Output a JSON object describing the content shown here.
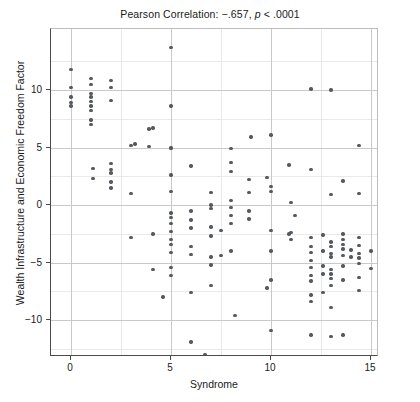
{
  "chart_data": {
    "type": "scatter",
    "title": "Pearson Correlation: −.657, p < .0001",
    "title_parts": {
      "prefix": "Pearson Correlation: −.657, ",
      "p_italic": "p",
      "suffix": " < .0001"
    },
    "xlabel": "Syndrome",
    "ylabel": "Wealth Infrastructure and Economic Freedom Factor",
    "xlim": [
      -1.0,
      15.4
    ],
    "ylim": [
      -13.2,
      15.3
    ],
    "xticks": [
      0,
      5,
      10,
      15
    ],
    "xtick_labels": [
      "0",
      "5",
      "10",
      "15"
    ],
    "yticks": [
      -10,
      -5,
      0,
      5,
      10
    ],
    "ytick_labels": [
      "−10",
      "−5",
      "0",
      "5",
      "10"
    ],
    "grid": true,
    "grid_major_step_x": 5,
    "grid_minor_step_x": 2.5,
    "grid_major_step_y": 5,
    "grid_minor_step_y": 2.5,
    "legend": null,
    "marker_color": "#555a5e",
    "marker_size": 3.4,
    "n_points": 144,
    "points": [
      [
        0.0,
        11.8
      ],
      [
        0.0,
        10.2
      ],
      [
        0.0,
        9.4
      ],
      [
        0.0,
        8.9
      ],
      [
        0.0,
        8.6
      ],
      [
        1.0,
        11.0
      ],
      [
        1.0,
        10.5
      ],
      [
        1.0,
        9.7
      ],
      [
        1.0,
        9.4
      ],
      [
        1.0,
        9.0
      ],
      [
        1.0,
        8.6
      ],
      [
        1.0,
        8.2
      ],
      [
        1.0,
        7.4
      ],
      [
        1.0,
        7.0
      ],
      [
        2.0,
        10.8
      ],
      [
        2.0,
        10.2
      ],
      [
        2.0,
        9.1
      ],
      [
        1.1,
        3.2
      ],
      [
        1.1,
        2.3
      ],
      [
        2.0,
        3.6
      ],
      [
        2.0,
        3.1
      ],
      [
        2.0,
        2.8
      ],
      [
        2.0,
        2.0
      ],
      [
        2.0,
        1.5
      ],
      [
        3.0,
        5.2
      ],
      [
        3.0,
        1.0
      ],
      [
        3.0,
        -2.8
      ],
      [
        3.9,
        5.1
      ],
      [
        3.9,
        6.6
      ],
      [
        5.0,
        13.7
      ],
      [
        5.0,
        8.6
      ],
      [
        5.0,
        4.9
      ],
      [
        5.0,
        5.0
      ],
      [
        5.0,
        2.6
      ],
      [
        5.0,
        1.2
      ],
      [
        5.0,
        -0.7
      ],
      [
        5.0,
        -1.1
      ],
      [
        5.0,
        -1.6
      ],
      [
        5.0,
        -2.3
      ],
      [
        5.0,
        -3.0
      ],
      [
        5.0,
        -3.4
      ],
      [
        5.0,
        -4.1
      ],
      [
        5.0,
        -5.4
      ],
      [
        5.0,
        -6.1
      ],
      [
        4.1,
        6.7
      ],
      [
        4.1,
        -2.5
      ],
      [
        4.1,
        -5.6
      ],
      [
        6.0,
        3.4
      ],
      [
        6.0,
        -0.5
      ],
      [
        6.0,
        -1.3
      ],
      [
        6.0,
        -2.0
      ],
      [
        6.0,
        -3.6
      ],
      [
        6.0,
        -4.3
      ],
      [
        6.0,
        -7.6
      ],
      [
        6.0,
        -11.9
      ],
      [
        7.0,
        1.1
      ],
      [
        7.0,
        0.0
      ],
      [
        7.0,
        -0.3
      ],
      [
        7.0,
        -1.9
      ],
      [
        7.0,
        -2.7
      ],
      [
        7.0,
        -4.5
      ],
      [
        7.0,
        -5.2
      ],
      [
        7.0,
        -7.0
      ],
      [
        7.5,
        -2.2
      ],
      [
        7.5,
        -4.4
      ],
      [
        8.0,
        4.9
      ],
      [
        8.0,
        3.7
      ],
      [
        8.0,
        2.9
      ],
      [
        8.0,
        0.4
      ],
      [
        8.0,
        -0.2
      ],
      [
        8.0,
        -0.9
      ],
      [
        8.0,
        -1.6
      ],
      [
        8.0,
        -4.0
      ],
      [
        8.2,
        -9.6
      ],
      [
        8.9,
        2.2
      ],
      [
        8.9,
        1.1
      ],
      [
        8.9,
        -0.5
      ],
      [
        8.9,
        -1.2
      ],
      [
        9.0,
        5.9
      ],
      [
        10.0,
        6.1
      ],
      [
        10.0,
        1.6
      ],
      [
        10.0,
        1.2
      ],
      [
        10.0,
        -2.2
      ],
      [
        10.0,
        -4.0
      ],
      [
        10.0,
        -6.5
      ],
      [
        10.0,
        -10.9
      ],
      [
        10.9,
        3.5
      ],
      [
        10.9,
        -2.5
      ],
      [
        11.0,
        0.2
      ],
      [
        11.0,
        -2.4
      ],
      [
        11.0,
        -3.0
      ],
      [
        11.2,
        -0.9
      ],
      [
        12.0,
        10.1
      ],
      [
        12.0,
        3.1
      ],
      [
        12.0,
        -2.8
      ],
      [
        12.0,
        -3.6
      ],
      [
        12.0,
        -4.1
      ],
      [
        12.0,
        -4.8
      ],
      [
        12.0,
        -5.4
      ],
      [
        12.0,
        -6.1
      ],
      [
        12.0,
        -6.6
      ],
      [
        12.0,
        -7.8
      ],
      [
        12.0,
        -8.4
      ],
      [
        12.0,
        -11.3
      ],
      [
        12.6,
        -2.6
      ],
      [
        12.6,
        -4.0
      ],
      [
        12.6,
        -5.3
      ],
      [
        12.6,
        -6.0
      ],
      [
        12.6,
        -7.6
      ],
      [
        13.0,
        10.0
      ],
      [
        13.0,
        0.9
      ],
      [
        13.0,
        -3.2
      ],
      [
        13.0,
        -3.6
      ],
      [
        13.0,
        -4.2
      ],
      [
        13.0,
        -4.5
      ],
      [
        13.0,
        -5.6
      ],
      [
        13.0,
        -6.0
      ],
      [
        13.0,
        -6.4
      ],
      [
        13.0,
        -7.0
      ],
      [
        13.0,
        -8.9
      ],
      [
        13.0,
        -11.4
      ],
      [
        13.6,
        2.1
      ],
      [
        13.6,
        -2.5
      ],
      [
        13.6,
        -3.0
      ],
      [
        13.6,
        -3.4
      ],
      [
        13.6,
        -3.8
      ],
      [
        13.6,
        -4.4
      ],
      [
        13.6,
        -5.3
      ],
      [
        13.6,
        -6.5
      ],
      [
        13.6,
        -11.3
      ],
      [
        14.0,
        -3.9
      ],
      [
        14.0,
        -4.5
      ],
      [
        14.4,
        5.2
      ],
      [
        14.4,
        1.0
      ],
      [
        14.4,
        -2.8
      ],
      [
        14.4,
        -3.5
      ],
      [
        14.4,
        -4.2
      ],
      [
        14.4,
        -4.6
      ],
      [
        14.4,
        -5.1
      ],
      [
        14.4,
        -6.3
      ],
      [
        14.4,
        -7.4
      ],
      [
        15.0,
        -4.0
      ],
      [
        15.0,
        -5.5
      ],
      [
        9.8,
        2.4
      ],
      [
        9.8,
        -7.2
      ],
      [
        6.7,
        -13.0
      ],
      [
        3.2,
        5.3
      ],
      [
        4.6,
        -8.0
      ]
    ]
  }
}
